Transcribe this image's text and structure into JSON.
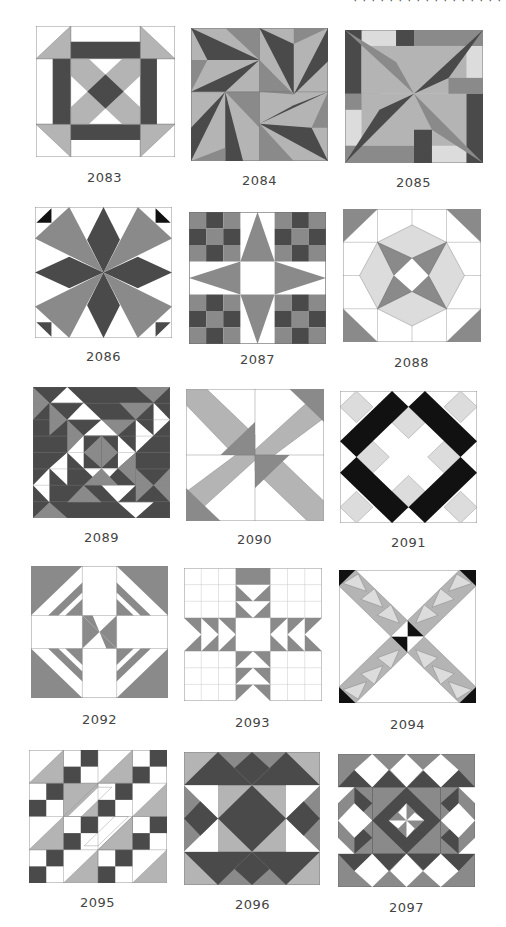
{
  "page": {
    "header_fragment": "· · · · · · · · ·   · · · · · · ·   ·",
    "colors": {
      "dark": "#4a4a4a",
      "medium": "#8a8a8a",
      "light": "#b4b4b4",
      "pale": "#dcdcdc",
      "black": "#111111",
      "white": "#ffffff",
      "outline": "#777777",
      "label_text": "#444444"
    }
  },
  "blocks": [
    {
      "number": "2083"
    },
    {
      "number": "2084"
    },
    {
      "number": "2085"
    },
    {
      "number": "2086"
    },
    {
      "number": "2087"
    },
    {
      "number": "2088"
    },
    {
      "number": "2089"
    },
    {
      "number": "2090"
    },
    {
      "number": "2091"
    },
    {
      "number": "2092"
    },
    {
      "number": "2093"
    },
    {
      "number": "2094"
    },
    {
      "number": "2095"
    },
    {
      "number": "2096"
    },
    {
      "number": "2097"
    }
  ]
}
